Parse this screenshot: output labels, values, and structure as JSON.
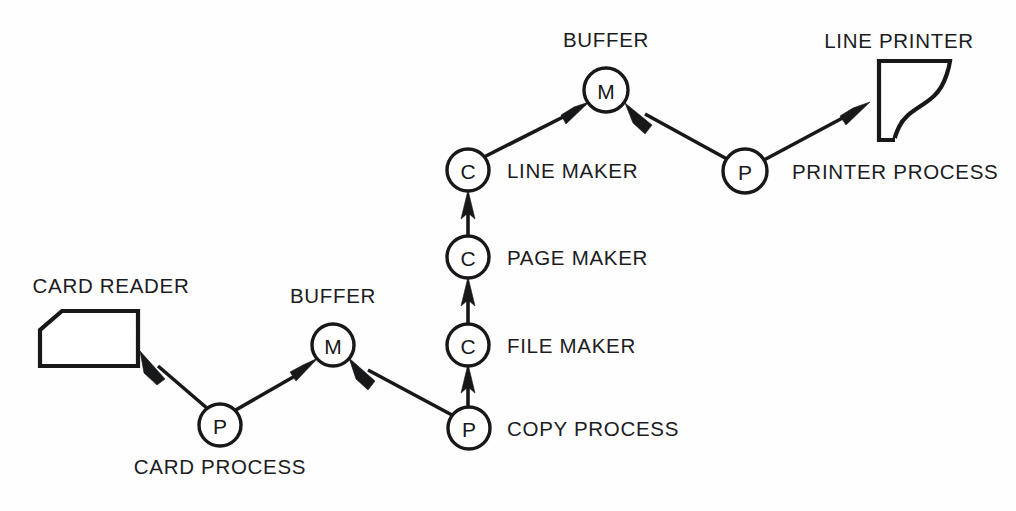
{
  "diagram": {
    "background_color": "#fefefe",
    "ink_color": "#17181a",
    "devices": [
      {
        "id": "card-reader",
        "label": "CARD READER",
        "shape": "punched-card",
        "label_x": 111,
        "label_y": 293
      },
      {
        "id": "line-printer",
        "label": "LINE PRINTER",
        "shape": "printer-paper",
        "label_x": 899,
        "label_y": 48
      }
    ],
    "nodes": [
      {
        "id": "card-process",
        "letter": "P",
        "kind": "process",
        "label": "CARD PROCESS",
        "cx": 220,
        "cy": 425,
        "r": 21,
        "label_x": 220,
        "label_y": 474,
        "label_anchor": "middle"
      },
      {
        "id": "buffer-lower",
        "letter": "M",
        "kind": "buffer",
        "label": "BUFFER",
        "cx": 333,
        "cy": 345,
        "r": 21,
        "label_x": 333,
        "label_y": 303,
        "label_anchor": "middle"
      },
      {
        "id": "copy-process",
        "letter": "P",
        "kind": "process",
        "label": "COPY PROCESS",
        "cx": 469,
        "cy": 428,
        "r": 21,
        "label_x": 507,
        "label_y": 436,
        "label_anchor": "start"
      },
      {
        "id": "file-maker",
        "letter": "C",
        "kind": "class",
        "label": "FILE MAKER",
        "cx": 468,
        "cy": 345,
        "r": 21,
        "label_x": 507,
        "label_y": 353,
        "label_anchor": "start"
      },
      {
        "id": "page-maker",
        "letter": "C",
        "kind": "class",
        "label": "PAGE MAKER",
        "cx": 468,
        "cy": 257,
        "r": 21,
        "label_x": 507,
        "label_y": 265,
        "label_anchor": "start"
      },
      {
        "id": "line-maker",
        "letter": "C",
        "kind": "class",
        "label": "LINE MAKER",
        "cx": 468,
        "cy": 170,
        "r": 21,
        "label_x": 507,
        "label_y": 178,
        "label_anchor": "start"
      },
      {
        "id": "buffer-upper",
        "letter": "M",
        "kind": "buffer",
        "label": "BUFFER",
        "cx": 606,
        "cy": 90,
        "r": 22,
        "label_x": 606,
        "label_y": 47,
        "label_anchor": "middle"
      },
      {
        "id": "printer-process",
        "letter": "P",
        "kind": "process",
        "label": "PRINTER PROCESS",
        "cx": 745,
        "cy": 171,
        "r": 22,
        "label_x": 792,
        "label_y": 179,
        "label_anchor": "start"
      }
    ],
    "edges": [
      {
        "from": "card-process",
        "to": "card-reader"
      },
      {
        "from": "card-process",
        "to": "buffer-lower"
      },
      {
        "from": "copy-process",
        "to": "buffer-lower"
      },
      {
        "from": "copy-process",
        "to": "file-maker"
      },
      {
        "from": "file-maker",
        "to": "page-maker"
      },
      {
        "from": "page-maker",
        "to": "line-maker"
      },
      {
        "from": "line-maker",
        "to": "buffer-upper"
      },
      {
        "from": "printer-process",
        "to": "buffer-upper"
      },
      {
        "from": "printer-process",
        "to": "line-printer"
      }
    ]
  }
}
